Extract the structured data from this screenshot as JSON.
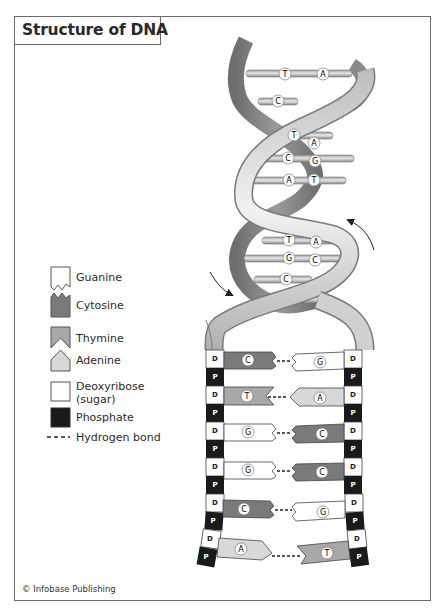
{
  "title": "Structure of DNA",
  "credit": "© Infobase Publishing",
  "colors": {
    "frame": "#6a6a6a",
    "guanine": "#ffffff",
    "cytosine": "#7a7a7a",
    "thymine": "#a8a8a8",
    "adenine": "#d8d8d8",
    "deoxyribose": "#ffffff",
    "phosphate": "#1a1a1a",
    "helix_back": "#8a8a8a",
    "helix_front": "#d4d4d4"
  },
  "legend": {
    "items": [
      {
        "key": "guanine",
        "label": "Guanine"
      },
      {
        "key": "cytosine",
        "label": "Cytosine"
      },
      {
        "key": "thymine",
        "label": "Thymine"
      },
      {
        "key": "adenine",
        "label": "Adenine"
      },
      {
        "key": "deoxyribose",
        "label": "Deoxyribose",
        "label2": "(sugar)"
      },
      {
        "key": "phosphate",
        "label": "Phosphate"
      },
      {
        "key": "hydrogen_bond",
        "label": "Hydrogen bond",
        "symbol": "- - -"
      }
    ]
  },
  "helix": {
    "base_pairs": [
      {
        "left": "T",
        "right": "A"
      },
      {
        "left": "C",
        "right": ""
      },
      {
        "left": "T",
        "right": "A"
      },
      {
        "left": "C",
        "right": "G"
      },
      {
        "left": "A",
        "right": "T"
      },
      {
        "left": "T",
        "right": "A"
      },
      {
        "left": "G",
        "right": "C"
      },
      {
        "left": "C",
        "right": ""
      }
    ],
    "rotation_arrows": [
      "clockwise-left",
      "counterclockwise-right"
    ]
  },
  "ladder": {
    "sugar_label": "D",
    "phosphate_label": "P",
    "rungs": [
      {
        "left": "C",
        "right": "G"
      },
      {
        "left": "T",
        "right": "A"
      },
      {
        "left": "G",
        "right": "C"
      },
      {
        "left": "G",
        "right": "C"
      },
      {
        "left": "C",
        "right": "G"
      },
      {
        "left": "A",
        "right": "T"
      }
    ]
  }
}
